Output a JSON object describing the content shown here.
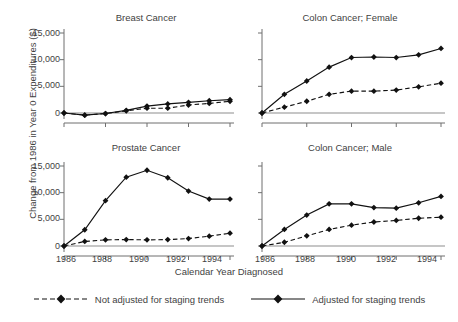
{
  "figure": {
    "ylabel": "Change from 1986 in Year 0 Expenditures ($)",
    "xlabel": "Calendar Year Diagnosed",
    "yticks": [
      "0",
      "5,000",
      "10,000",
      "15,000"
    ],
    "xticks": [
      "1986",
      "1988",
      "1990",
      "1992",
      "1994"
    ]
  },
  "legend": {
    "items": [
      {
        "label": "Not adjusted for staging trends",
        "style": "dashed",
        "marker": "diamond",
        "color": "#111111"
      },
      {
        "label": "Adjusted for staging trends",
        "style": "solid",
        "marker": "diamond",
        "color": "#111111"
      }
    ]
  },
  "panels": [
    {
      "key": "breast",
      "title": "Breast Cancer"
    },
    {
      "key": "colon_female",
      "title": "Colon Cancer; Female"
    },
    {
      "key": "prostate",
      "title": "Prostate Cancer"
    },
    {
      "key": "colon_male",
      "title": "Colon Cancer; Male"
    }
  ],
  "chart_data": [
    {
      "type": "line",
      "title": "Breast Cancer",
      "xlabel": "Calendar Year Diagnosed",
      "ylabel": "Change from 1986 in Year 0 Expenditures ($)",
      "x": [
        1986,
        1987,
        1988,
        1989,
        1990,
        1991,
        1992,
        1993,
        1994
      ],
      "xlim": [
        1986,
        1994
      ],
      "ylim": [
        -1500,
        16500
      ],
      "yticks": [
        0,
        5000,
        10000,
        15000
      ],
      "grid": false,
      "legend_position": "bottom",
      "series": [
        {
          "name": "Not adjusted for staging trends",
          "style": "dashed",
          "values": [
            0,
            -400,
            -100,
            400,
            900,
            900,
            1500,
            1800,
            2200
          ]
        },
        {
          "name": "Adjusted for staging trends",
          "style": "solid",
          "values": [
            0,
            -400,
            -100,
            500,
            1300,
            1700,
            2000,
            2300,
            2500
          ]
        }
      ]
    },
    {
      "type": "line",
      "title": "Colon Cancer; Female",
      "xlabel": "Calendar Year Diagnosed",
      "ylabel": "Change from 1986 in Year 0 Expenditures ($)",
      "x": [
        1986,
        1987,
        1988,
        1989,
        1990,
        1991,
        1992,
        1993,
        1994
      ],
      "xlim": [
        1986,
        1994
      ],
      "ylim": [
        -1500,
        16500
      ],
      "yticks": [
        0,
        5000,
        10000,
        15000
      ],
      "grid": false,
      "legend_position": "bottom",
      "series": [
        {
          "name": "Not adjusted for staging trends",
          "style": "dashed",
          "values": [
            0,
            1100,
            2200,
            3500,
            4100,
            4100,
            4300,
            4900,
            5600
          ]
        },
        {
          "name": "Adjusted for staging trends",
          "style": "solid",
          "values": [
            0,
            3500,
            6000,
            8600,
            10400,
            10500,
            10400,
            10900,
            12100
          ]
        }
      ]
    },
    {
      "type": "line",
      "title": "Prostate Cancer",
      "xlabel": "Calendar Year Diagnosed",
      "ylabel": "Change from 1986 in Year 0 Expenditures ($)",
      "x": [
        1986,
        1987,
        1988,
        1989,
        1990,
        1991,
        1992,
        1993,
        1994
      ],
      "xlim": [
        1986,
        1994
      ],
      "ylim": [
        -1500,
        16500
      ],
      "yticks": [
        0,
        5000,
        10000,
        15000
      ],
      "grid": false,
      "legend_position": "bottom",
      "series": [
        {
          "name": "Not adjusted for staging trends",
          "style": "dashed",
          "values": [
            0,
            850,
            1150,
            1200,
            1150,
            1200,
            1400,
            1850,
            2400
          ]
        },
        {
          "name": "Adjusted for staging trends",
          "style": "solid",
          "values": [
            0,
            3050,
            8500,
            12900,
            14200,
            12800,
            10300,
            8800,
            8800
          ]
        }
      ]
    },
    {
      "type": "line",
      "title": "Colon Cancer; Male",
      "xlabel": "Calendar Year Diagnosed",
      "ylabel": "Change from 1986 in Year 0 Expenditures ($)",
      "x": [
        1986,
        1987,
        1988,
        1989,
        1990,
        1991,
        1992,
        1993,
        1994
      ],
      "xlim": [
        1986,
        1994
      ],
      "ylim": [
        -1500,
        16500
      ],
      "yticks": [
        0,
        5000,
        10000,
        15000
      ],
      "grid": false,
      "legend_position": "bottom",
      "series": [
        {
          "name": "Not adjusted for staging trends",
          "style": "dashed",
          "values": [
            0,
            700,
            1900,
            3100,
            3900,
            4500,
            4800,
            5200,
            5400
          ]
        },
        {
          "name": "Adjusted for staging trends",
          "style": "solid",
          "values": [
            0,
            3100,
            5800,
            7900,
            7900,
            7200,
            7100,
            8100,
            9300
          ]
        }
      ]
    }
  ]
}
